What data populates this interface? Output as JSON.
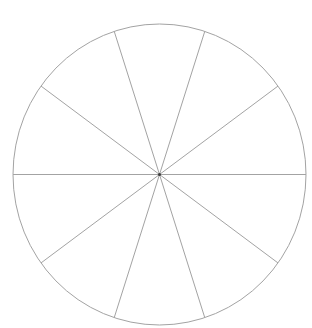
{
  "page": {
    "background_color": "#ffffff"
  },
  "chart_data": {
    "type": "pie",
    "title": "",
    "num_sectors": 10,
    "values": [
      10,
      10,
      10,
      10,
      10,
      10,
      10,
      10,
      10,
      10
    ],
    "unit": "percent",
    "sector_angle_deg": 36,
    "boundary_angles_deg": [
      0,
      36,
      72,
      108,
      144,
      180,
      216,
      252,
      288,
      324
    ],
    "slice_fill": "none",
    "stroke_color": "#a3a3a3",
    "stroke_width": 1,
    "center_dot_color": "#3c3c3c",
    "center_dot_radius": 1.5,
    "labels_shown": false,
    "legend_position": "none",
    "layout": {
      "canvas_width": 312,
      "canvas_height": 328,
      "cx": 159.5,
      "cy": 174.5,
      "rx": 146.5,
      "ry": 150.5
    }
  }
}
